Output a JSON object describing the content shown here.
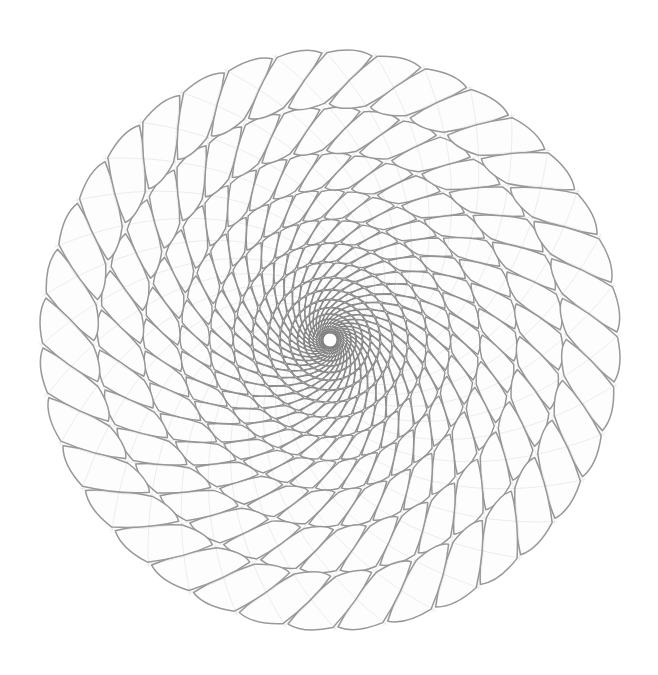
{
  "figure": {
    "title": "Spiral Rosette Lattice",
    "alt_text": "Radial sunflower-like geometric pattern of nested quadrilateral cells formed by two counter-rotating families of logarithmic spirals, densest and darkest at the centre, opening into petal-shaped rhombi at the rim.",
    "kind": "spiral-rosette-lattice",
    "background_color": "#ffffff",
    "stroke_color": "#8c8c8c",
    "stroke_color_inner": "#6e6e6e",
    "stroke_color_outer": "#9a9a9a",
    "cell_fill": "#fdfdfd",
    "canvas": {
      "width": 658,
      "height": 675
    },
    "geometry": {
      "center_x": 330,
      "center_y": 340,
      "inner_radius": 7,
      "outer_radius": 291,
      "arms": 36,
      "rings": 17,
      "twist_turns": 0.515,
      "radial_growth": "geometric",
      "radial_ratio": 1.255,
      "phase_offset_deg": 4,
      "cell_inset": 0.17,
      "stroke_width_inner": 0.85,
      "stroke_width_outer": 1.55,
      "extent": {
        "left": 45,
        "right": 615,
        "top": 45,
        "bottom": 635
      }
    },
    "spiral_families": [
      {
        "name": "clockwise-spiral-family",
        "count": 36,
        "direction": "clockwise"
      },
      {
        "name": "counterclockwise-spiral-family",
        "count": 36,
        "direction": "counterclockwise"
      }
    ]
  }
}
